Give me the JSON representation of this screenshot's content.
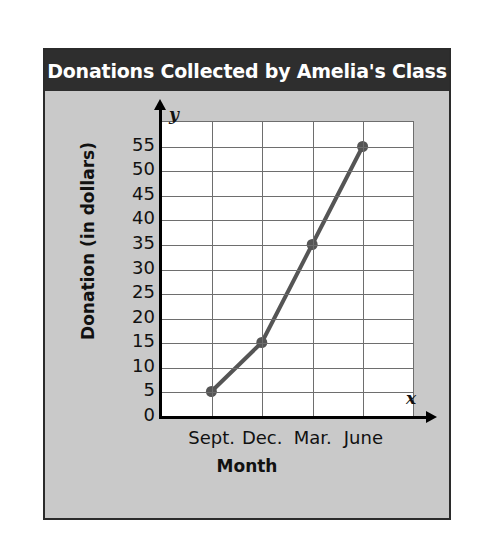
{
  "header": {
    "title": "Donations Collected by Amelia's Class"
  },
  "axis_markers": {
    "y": "y",
    "x": "x"
  },
  "chart_data": {
    "type": "line",
    "title": "Donations Collected by Amelia's Class",
    "xlabel": "Month",
    "ylabel": "Donation (in dollars)",
    "categories": [
      "Sept.",
      "Dec.",
      "Mar.",
      "June"
    ],
    "values": [
      5,
      15,
      35,
      55
    ],
    "yticks": [
      0,
      5,
      10,
      15,
      20,
      25,
      30,
      35,
      40,
      45,
      50,
      55
    ],
    "ylim": [
      0,
      60
    ],
    "grid": true,
    "legend": null,
    "series_color": "#555555",
    "marker": "circle",
    "plot_background": "#ffffff",
    "panel_background": "#c9c9c9",
    "header_background": "#2e2e2e",
    "header_text_color": "#ffffff"
  }
}
